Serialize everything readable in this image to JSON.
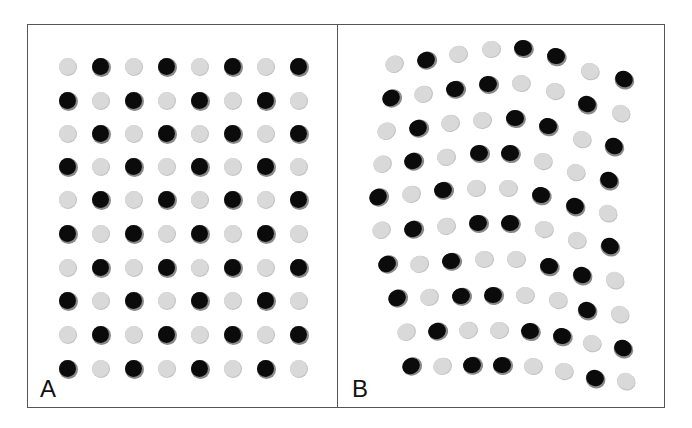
{
  "figure": {
    "panels": [
      {
        "id": "A",
        "label": "A",
        "description": "Regular grid of dots, alternating black and light-gray in a checkerboard pattern",
        "columns": [
          67,
          100,
          133,
          166,
          199,
          232,
          265,
          298
        ],
        "rows": [
          66,
          100,
          133,
          166,
          199,
          233,
          267,
          300,
          334,
          368
        ],
        "dot_size": 17,
        "pattern": "checkerboard",
        "first_color": "gray"
      },
      {
        "id": "B",
        "label": "B",
        "description": "Distorted/irregular arrangement of dots, black and light-gray, with slightly elliptical shapes",
        "dots": [
          {
            "x": 394,
            "y": 64,
            "c": "gray"
          },
          {
            "x": 426,
            "y": 60,
            "c": "black"
          },
          {
            "x": 458,
            "y": 54,
            "c": "gray"
          },
          {
            "x": 491,
            "y": 49,
            "c": "gray"
          },
          {
            "x": 523,
            "y": 48,
            "c": "black"
          },
          {
            "x": 556,
            "y": 56,
            "c": "black"
          },
          {
            "x": 590,
            "y": 71,
            "c": "gray"
          },
          {
            "x": 624,
            "y": 79,
            "c": "black"
          },
          {
            "x": 391,
            "y": 98,
            "c": "black"
          },
          {
            "x": 423,
            "y": 94,
            "c": "gray"
          },
          {
            "x": 455,
            "y": 89,
            "c": "black"
          },
          {
            "x": 488,
            "y": 84,
            "c": "black"
          },
          {
            "x": 521,
            "y": 83,
            "c": "gray"
          },
          {
            "x": 555,
            "y": 91,
            "c": "gray"
          },
          {
            "x": 587,
            "y": 104,
            "c": "black"
          },
          {
            "x": 621,
            "y": 113,
            "c": "gray"
          },
          {
            "x": 386,
            "y": 131,
            "c": "gray"
          },
          {
            "x": 418,
            "y": 128,
            "c": "black"
          },
          {
            "x": 450,
            "y": 123,
            "c": "gray"
          },
          {
            "x": 482,
            "y": 120,
            "c": "gray"
          },
          {
            "x": 515,
            "y": 118,
            "c": "black"
          },
          {
            "x": 548,
            "y": 126,
            "c": "black"
          },
          {
            "x": 582,
            "y": 139,
            "c": "gray"
          },
          {
            "x": 614,
            "y": 146,
            "c": "black"
          },
          {
            "x": 382,
            "y": 164,
            "c": "gray"
          },
          {
            "x": 413,
            "y": 161,
            "c": "black"
          },
          {
            "x": 446,
            "y": 157,
            "c": "gray"
          },
          {
            "x": 479,
            "y": 153,
            "c": "black"
          },
          {
            "x": 510,
            "y": 153,
            "c": "black"
          },
          {
            "x": 543,
            "y": 161,
            "c": "gray"
          },
          {
            "x": 576,
            "y": 172,
            "c": "gray"
          },
          {
            "x": 609,
            "y": 180,
            "c": "black"
          },
          {
            "x": 378,
            "y": 197,
            "c": "black"
          },
          {
            "x": 411,
            "y": 194,
            "c": "gray"
          },
          {
            "x": 443,
            "y": 190,
            "c": "black"
          },
          {
            "x": 476,
            "y": 188,
            "c": "gray"
          },
          {
            "x": 508,
            "y": 188,
            "c": "gray"
          },
          {
            "x": 541,
            "y": 195,
            "c": "black"
          },
          {
            "x": 575,
            "y": 206,
            "c": "black"
          },
          {
            "x": 608,
            "y": 213,
            "c": "gray"
          },
          {
            "x": 381,
            "y": 230,
            "c": "gray"
          },
          {
            "x": 413,
            "y": 229,
            "c": "black"
          },
          {
            "x": 446,
            "y": 226,
            "c": "gray"
          },
          {
            "x": 478,
            "y": 223,
            "c": "black"
          },
          {
            "x": 510,
            "y": 223,
            "c": "black"
          },
          {
            "x": 544,
            "y": 229,
            "c": "gray"
          },
          {
            "x": 577,
            "y": 240,
            "c": "gray"
          },
          {
            "x": 610,
            "y": 246,
            "c": "black"
          },
          {
            "x": 387,
            "y": 264,
            "c": "black"
          },
          {
            "x": 419,
            "y": 264,
            "c": "gray"
          },
          {
            "x": 451,
            "y": 261,
            "c": "black"
          },
          {
            "x": 484,
            "y": 259,
            "c": "gray"
          },
          {
            "x": 516,
            "y": 259,
            "c": "gray"
          },
          {
            "x": 549,
            "y": 266,
            "c": "black"
          },
          {
            "x": 582,
            "y": 275,
            "c": "black"
          },
          {
            "x": 615,
            "y": 280,
            "c": "gray"
          },
          {
            "x": 397,
            "y": 298,
            "c": "black"
          },
          {
            "x": 429,
            "y": 297,
            "c": "gray"
          },
          {
            "x": 461,
            "y": 296,
            "c": "black"
          },
          {
            "x": 493,
            "y": 295,
            "c": "black"
          },
          {
            "x": 525,
            "y": 295,
            "c": "gray"
          },
          {
            "x": 558,
            "y": 300,
            "c": "gray"
          },
          {
            "x": 587,
            "y": 310,
            "c": "black"
          },
          {
            "x": 620,
            "y": 314,
            "c": "gray"
          },
          {
            "x": 406,
            "y": 332,
            "c": "gray"
          },
          {
            "x": 437,
            "y": 331,
            "c": "black"
          },
          {
            "x": 468,
            "y": 330,
            "c": "gray"
          },
          {
            "x": 499,
            "y": 330,
            "c": "gray"
          },
          {
            "x": 530,
            "y": 331,
            "c": "black"
          },
          {
            "x": 562,
            "y": 336,
            "c": "black"
          },
          {
            "x": 592,
            "y": 343,
            "c": "gray"
          },
          {
            "x": 623,
            "y": 348,
            "c": "black"
          },
          {
            "x": 411,
            "y": 366,
            "c": "black"
          },
          {
            "x": 442,
            "y": 366,
            "c": "gray"
          },
          {
            "x": 472,
            "y": 365,
            "c": "black"
          },
          {
            "x": 502,
            "y": 365,
            "c": "black"
          },
          {
            "x": 533,
            "y": 366,
            "c": "gray"
          },
          {
            "x": 564,
            "y": 371,
            "c": "gray"
          },
          {
            "x": 595,
            "y": 378,
            "c": "black"
          },
          {
            "x": 626,
            "y": 381,
            "c": "gray"
          }
        ],
        "dot_size": 17
      }
    ],
    "colors": {
      "black_dot": "#0b0b0b",
      "gray_dot": "#d9d9d9",
      "border": "#555555",
      "background": "#ffffff"
    }
  }
}
